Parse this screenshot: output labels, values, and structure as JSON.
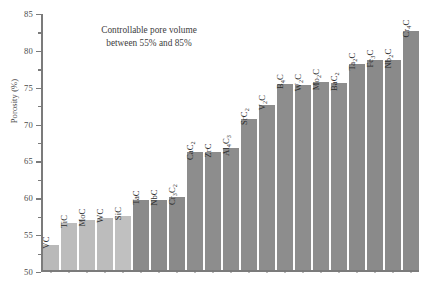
{
  "chart_data": {
    "type": "bar",
    "title": "",
    "annotation": [
      "Controllable pore volume",
      "between 55% and 85%"
    ],
    "xlabel": "",
    "ylabel": "Porosity (%)",
    "ylim": [
      50,
      85
    ],
    "ytick_step": 5,
    "yticks": [
      50,
      55,
      60,
      65,
      70,
      75,
      80,
      85
    ],
    "ytick_labels": [
      "50",
      "55",
      "60",
      "65",
      "70",
      "75",
      "80",
      "85"
    ],
    "minor_ticks": true,
    "grid": false,
    "legend": "none",
    "categories": [
      "VC",
      "TiC",
      "MoC",
      "WC",
      "SiC",
      "TaC",
      "NbC",
      "Cr3C2",
      "CaC2",
      "ZrC",
      "Al4C3",
      "SrC2",
      "V2C",
      "B4C",
      "W2C",
      "Mo2C",
      "BaC2",
      "Ta2C",
      "Fe3C",
      "Nb2C",
      "Cr4C"
    ],
    "bars": [
      {
        "label": "VC",
        "formula": [
          [
            "V",
            ""
          ],
          [
            "C",
            ""
          ]
        ],
        "value": 53.5,
        "color": "#b9b9b9"
      },
      {
        "label": "TiC",
        "formula": [
          [
            "Ti",
            ""
          ],
          [
            "C",
            ""
          ]
        ],
        "value": 56.4,
        "color": "#bcbcbc"
      },
      {
        "label": "MoC",
        "formula": [
          [
            "Mo",
            ""
          ],
          [
            "C",
            ""
          ]
        ],
        "value": 56.9,
        "color": "#bcbcbc"
      },
      {
        "label": "WC",
        "formula": [
          [
            "W",
            ""
          ],
          [
            "C",
            ""
          ]
        ],
        "value": 57.1,
        "color": "#bcbcbc"
      },
      {
        "label": "SiC",
        "formula": [
          [
            "Si",
            ""
          ],
          [
            "C",
            ""
          ]
        ],
        "value": 57.4,
        "color": "#c0c0c0"
      },
      {
        "label": "TaC",
        "formula": [
          [
            "Ta",
            ""
          ],
          [
            "C",
            ""
          ]
        ],
        "value": 59.6,
        "color": "#8a8a8a"
      },
      {
        "label": "NbC",
        "formula": [
          [
            "Nb",
            ""
          ],
          [
            "C",
            ""
          ]
        ],
        "value": 59.6,
        "color": "#8a8a8a"
      },
      {
        "label": "Cr3C2",
        "formula": [
          [
            "Cr",
            "3"
          ],
          [
            "C",
            "2"
          ]
        ],
        "value": 60.0,
        "color": "#8a8a8a"
      },
      {
        "label": "CaC2",
        "formula": [
          [
            "Ca",
            ""
          ],
          [
            "C",
            "2"
          ]
        ],
        "value": 66.0,
        "color": "#8d8d8d"
      },
      {
        "label": "ZrC",
        "formula": [
          [
            "Zr",
            ""
          ],
          [
            "C",
            ""
          ]
        ],
        "value": 66.0,
        "color": "#8d8d8d"
      },
      {
        "label": "Al4C3",
        "formula": [
          [
            "Al",
            "4"
          ],
          [
            "C",
            "3"
          ]
        ],
        "value": 66.6,
        "color": "#8d8d8d"
      },
      {
        "label": "SrC2",
        "formula": [
          [
            "Sr",
            ""
          ],
          [
            "C",
            "2"
          ]
        ],
        "value": 70.6,
        "color": "#8d8d8d"
      },
      {
        "label": "V2C",
        "formula": [
          [
            "V",
            "2"
          ],
          [
            "C",
            ""
          ]
        ],
        "value": 72.5,
        "color": "#8d8d8d"
      },
      {
        "label": "B4C",
        "formula": [
          [
            "B",
            "4"
          ],
          [
            "C",
            ""
          ]
        ],
        "value": 75.3,
        "color": "#8d8d8d"
      },
      {
        "label": "W2C",
        "formula": [
          [
            "W",
            "2"
          ],
          [
            "C",
            ""
          ]
        ],
        "value": 75.2,
        "color": "#8d8d8d"
      },
      {
        "label": "Mo2C",
        "formula": [
          [
            "Mo",
            "2"
          ],
          [
            "C",
            ""
          ]
        ],
        "value": 75.6,
        "color": "#8d8d8d"
      },
      {
        "label": "BaC2",
        "formula": [
          [
            "Ba",
            ""
          ],
          [
            "C",
            "2"
          ]
        ],
        "value": 75.4,
        "color": "#8d8d8d"
      },
      {
        "label": "Ta2C",
        "formula": [
          [
            "Ta",
            "2"
          ],
          [
            "C",
            ""
          ]
        ],
        "value": 78.0,
        "color": "#8a8a8a"
      },
      {
        "label": "Fe3C",
        "formula": [
          [
            "Fe",
            "3"
          ],
          [
            "C",
            ""
          ]
        ],
        "value": 78.5,
        "color": "#8a8a8a"
      },
      {
        "label": "Nb2C",
        "formula": [
          [
            "Nb",
            "2"
          ],
          [
            "C",
            ""
          ]
        ],
        "value": 78.5,
        "color": "#8a8a8a"
      },
      {
        "label": "Cr4C",
        "formula": [
          [
            "Cr",
            "4"
          ],
          [
            "C",
            ""
          ]
        ],
        "value": 82.5,
        "color": "#8a8a8a"
      }
    ],
    "colors": {
      "light_bar": "#bcbcbc",
      "dark_bar": "#8b8b8b",
      "axis": "#7b7b7b",
      "text": "#3a3a3a"
    }
  }
}
